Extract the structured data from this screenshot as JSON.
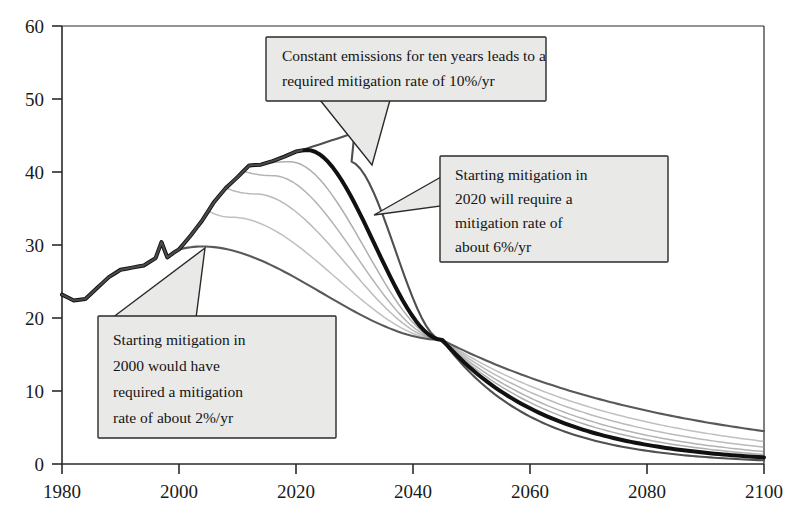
{
  "chart_data": {
    "type": "line",
    "title": "",
    "xlabel": "",
    "ylabel": "",
    "xlim": [
      1980,
      2100
    ],
    "ylim": [
      0,
      60
    ],
    "grid": false,
    "legend": "none",
    "x_ticks": [
      "1980",
      "2000",
      "2020",
      "2040",
      "2060",
      "2080",
      "2100"
    ],
    "y_ticks": [
      "0",
      "10",
      "20",
      "30",
      "40",
      "50",
      "60"
    ],
    "annotations": [
      {
        "id": "annotation-10pct",
        "text_line_1": "Constant emissions for ten years leads to a",
        "text_line_2": "required mitigation rate of 10%/yr",
        "points_to_year": 2030,
        "points_to_value": 41
      },
      {
        "id": "annotation-6pct",
        "text_line_1": "Starting mitigation in",
        "text_line_2": "2020 will require a",
        "text_line_3": "mitigation rate of",
        "text_line_4": "about 6%/yr",
        "points_to_year": 2027,
        "points_to_value": 36
      },
      {
        "id": "annotation-2pct",
        "text_line_1": "Starting mitigation in",
        "text_line_2": "2000 would have",
        "text_line_3": "required a mitigation",
        "text_line_4": "rate of about 2%/yr",
        "points_to_year": 2004,
        "points_to_value": 29.6
      }
    ],
    "series": [
      {
        "name": "historical-emissions",
        "role": "historical",
        "emphasis": "medium",
        "color": "#4a4a4a",
        "x": [
          1980,
          1982,
          1984,
          1986,
          1988,
          1990,
          1992,
          1994,
          1996,
          1997,
          1998,
          1999,
          2000,
          2002,
          2004,
          2006,
          2008,
          2010,
          2012,
          2014,
          2016,
          2018,
          2020,
          2021
        ],
        "y": [
          23.2,
          22.4,
          22.6,
          24.1,
          25.6,
          26.6,
          26.9,
          27.2,
          28.2,
          30.4,
          28.3,
          28.9,
          29.4,
          31.3,
          33.4,
          35.9,
          37.8,
          39.3,
          40.9,
          41.0,
          41.5,
          42.1,
          42.8,
          43.0
        ]
      },
      {
        "name": "mitigation-from-2000-2pct",
        "role": "scenario",
        "branch_year": 2000,
        "mitigation_rate_pct_per_year": 2,
        "emphasis": "medium",
        "color": "#595959",
        "peak_year": 2004,
        "peak_value": 29.8,
        "value_2045": 17.0,
        "value_2100": 4.5
      },
      {
        "name": "mitigation-from-2005-3pct",
        "role": "scenario",
        "branch_year": 2005,
        "mitigation_rate_pct_per_year": 3,
        "emphasis": "light",
        "color": "#9a9a9a",
        "peak_year": 2009,
        "peak_value": 33.8,
        "value_2045": 17.0,
        "value_2100": 3.1
      },
      {
        "name": "mitigation-from-2008-4pct",
        "role": "scenario",
        "branch_year": 2008,
        "mitigation_rate_pct_per_year": 4,
        "emphasis": "light",
        "color": "#8f8f8f",
        "peak_year": 2013,
        "peak_value": 37.0,
        "value_2045": 17.0,
        "value_2100": 2.3
      },
      {
        "name": "mitigation-from-2011-5pct",
        "role": "scenario",
        "branch_year": 2011,
        "mitigation_rate_pct_per_year": 5,
        "emphasis": "light",
        "color": "#858585",
        "peak_year": 2016,
        "peak_value": 39.5,
        "value_2045": 17.0,
        "value_2100": 1.7
      },
      {
        "name": "mitigation-from-2015-5-5pct",
        "role": "scenario",
        "branch_year": 2015,
        "mitigation_rate_pct_per_year": 5.5,
        "emphasis": "light",
        "color": "#7d7d7d",
        "peak_year": 2019,
        "peak_value": 41.4,
        "value_2045": 17.0,
        "value_2100": 1.3
      },
      {
        "name": "mitigation-from-2020-6pct",
        "role": "scenario-highlighted",
        "branch_year": 2020,
        "mitigation_rate_pct_per_year": 6,
        "emphasis": "bold",
        "color": "#111111",
        "peak_year": 2022,
        "peak_value": 43.0,
        "value_2045": 17.0,
        "value_2100": 0.9
      },
      {
        "name": "mitigation-from-2030-10pct",
        "role": "scenario",
        "branch_year": 2030,
        "mitigation_rate_pct_per_year": 10,
        "emphasis": "medium",
        "color": "#4f4f4f",
        "peak_year": 2029,
        "peak_value": 41.5,
        "value_2045": 17.0,
        "value_2100": 0.5
      }
    ],
    "convergence": {
      "year": 2045,
      "value": 17.0,
      "note": "all mitigation pathways cross near this point"
    }
  },
  "axis": {
    "y_tick_values": [
      0,
      10,
      20,
      30,
      40,
      50,
      60
    ],
    "x_tick_values": [
      1980,
      2000,
      2020,
      2040,
      2060,
      2080,
      2100
    ]
  }
}
